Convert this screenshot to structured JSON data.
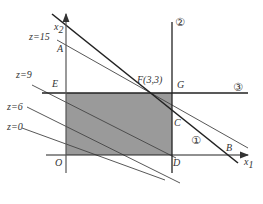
{
  "diagram": {
    "type": "linear-programming-feasible-region",
    "axes": {
      "x_label": "x",
      "x_sub": "1",
      "y_label": "x",
      "y_sub": "2",
      "origin": "O"
    },
    "points": {
      "A": "A",
      "B": "B",
      "C": "C",
      "D": "D",
      "E": "E",
      "G": "G",
      "F": "F(3,3)"
    },
    "constraints": [
      "①",
      "②",
      "③"
    ],
    "objective_lines": [
      {
        "label": "z=15"
      },
      {
        "label": "z=9"
      },
      {
        "label": "z=6"
      },
      {
        "label": "z=0"
      }
    ],
    "colors": {
      "shade": "#9a9a9a",
      "line": "#333333",
      "background": "#ffffff"
    }
  }
}
